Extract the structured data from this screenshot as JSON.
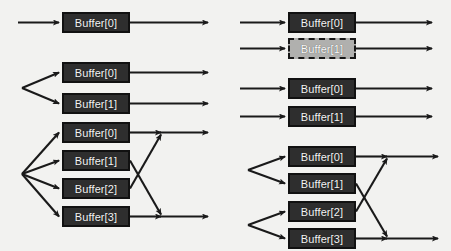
{
  "diagram": {
    "type": "block-diagram",
    "background_color": "#f2f2f0",
    "box_fill_color": "#2e2e2e",
    "box_border_color": "#111111",
    "box_text_color": "#f4f4f4",
    "disabled_box_fill_color": "#b0b0ae",
    "disabled_box_border_color": "#161616",
    "arrow_color": "#1a1a1a",
    "groups": [
      {
        "id": "left-single",
        "column": "left",
        "input_style": "single",
        "output_style": "single",
        "boxes": [
          {
            "label": "Buffer[0]",
            "state": "active",
            "x": 62,
            "y": 12,
            "w": 68,
            "h": 21
          }
        ]
      },
      {
        "id": "left-dual",
        "column": "left",
        "input_style": "fan-out-2",
        "output_style": "parallel",
        "boxes": [
          {
            "label": "Buffer[0]",
            "state": "active",
            "x": 62,
            "y": 62,
            "w": 68,
            "h": 21
          },
          {
            "label": "Buffer[1]",
            "state": "active",
            "x": 62,
            "y": 93,
            "w": 68,
            "h": 21
          }
        ]
      },
      {
        "id": "left-quad",
        "column": "left",
        "input_style": "fan-out-4",
        "output_style": "cross-merge-2",
        "boxes": [
          {
            "label": "Buffer[0]",
            "state": "active",
            "x": 62,
            "y": 122,
            "w": 68,
            "h": 21
          },
          {
            "label": "Buffer[1]",
            "state": "active",
            "x": 62,
            "y": 150,
            "w": 68,
            "h": 21
          },
          {
            "label": "Buffer[2]",
            "state": "active",
            "x": 62,
            "y": 178,
            "w": 68,
            "h": 21
          },
          {
            "label": "Buffer[3]",
            "state": "active",
            "x": 62,
            "y": 206,
            "w": 68,
            "h": 21
          }
        ]
      },
      {
        "id": "right-dual-disabled",
        "column": "right",
        "input_style": "parallel",
        "output_style": "parallel",
        "boxes": [
          {
            "label": "Buffer[0]",
            "state": "active",
            "x": 288,
            "y": 12,
            "w": 68,
            "h": 21
          },
          {
            "label": "Buffer[1]",
            "state": "disabled",
            "x": 288,
            "y": 38,
            "w": 68,
            "h": 21
          }
        ]
      },
      {
        "id": "right-dual",
        "column": "right",
        "input_style": "parallel",
        "output_style": "parallel",
        "boxes": [
          {
            "label": "Buffer[0]",
            "state": "active",
            "x": 288,
            "y": 78,
            "w": 68,
            "h": 21
          },
          {
            "label": "Buffer[1]",
            "state": "active",
            "x": 288,
            "y": 106,
            "w": 68,
            "h": 21
          }
        ]
      },
      {
        "id": "right-quad",
        "column": "right",
        "input_style": "fan-out-2-paired",
        "output_style": "cross-merge-2",
        "boxes": [
          {
            "label": "Buffer[0]",
            "state": "active",
            "x": 288,
            "y": 146,
            "w": 68,
            "h": 21
          },
          {
            "label": "Buffer[1]",
            "state": "active",
            "x": 288,
            "y": 173,
            "w": 68,
            "h": 21
          },
          {
            "label": "Buffer[2]",
            "state": "active",
            "x": 288,
            "y": 201,
            "w": 68,
            "h": 21
          },
          {
            "label": "Buffer[3]",
            "state": "active",
            "x": 288,
            "y": 228,
            "w": 68,
            "h": 21
          }
        ]
      }
    ]
  }
}
